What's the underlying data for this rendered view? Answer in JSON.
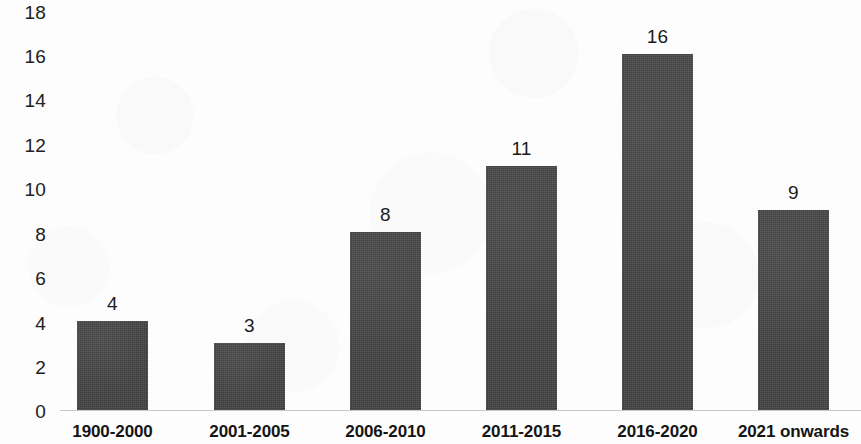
{
  "chart_data": {
    "type": "bar",
    "title": "",
    "subtitle": "",
    "xlabel": "",
    "ylabel": "",
    "categories": [
      "1900-2000",
      "2001-2005",
      "2006-2010",
      "2011-2015",
      "2016-2020",
      "2021 onwards"
    ],
    "values": [
      4,
      3,
      8,
      11,
      16,
      9
    ],
    "data_labels": [
      "4",
      "3",
      "8",
      "11",
      "16",
      "9"
    ],
    "ylim": [
      0,
      18
    ],
    "ytick_step": 2,
    "ytick_labels": [
      "18",
      "16",
      "14",
      "12",
      "10",
      "8",
      "6",
      "4",
      "2",
      "0"
    ],
    "ytick_values": [
      18,
      16,
      14,
      12,
      10,
      8,
      6,
      4,
      2,
      0
    ],
    "grid": false,
    "legend": null,
    "legend_position": "none",
    "bar_color": "#434343",
    "axis_line_color": "#c9c9c9",
    "background_color": "#fdfdfd",
    "text_color": "#1c1c1c"
  }
}
